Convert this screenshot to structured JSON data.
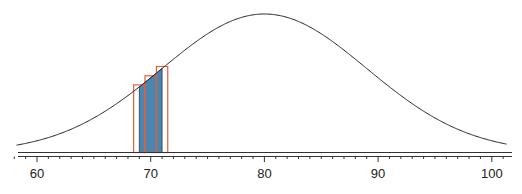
{
  "chart_data": {
    "type": "area",
    "title": "",
    "xlabel": "",
    "ylabel": "",
    "distribution": {
      "kind": "normal",
      "mean": 80,
      "sd": 9
    },
    "xlim": [
      58.2,
      101.3
    ],
    "x_ticks": [
      60,
      70,
      80,
      90,
      100
    ],
    "x_tick_labels": [
      "60",
      "70",
      "80",
      "90",
      "100"
    ],
    "minor_tick_step": 1,
    "shaded_region": {
      "from": 69,
      "to": 71,
      "color": "#4a86b0"
    },
    "bars": [
      {
        "center": 69,
        "from": 68.5,
        "to": 69.5,
        "height": 0.0246
      },
      {
        "center": 70,
        "from": 69.5,
        "to": 70.5,
        "height": 0.0268
      },
      {
        "center": 71,
        "from": 70.5,
        "to": 71.5,
        "height": 0.0288
      }
    ],
    "bar_outline_color": "#e0603a",
    "curve_color": "#222222",
    "grid": false,
    "legend": null
  }
}
